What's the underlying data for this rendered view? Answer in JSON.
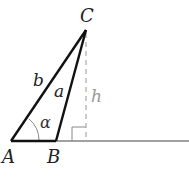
{
  "diagram": {
    "vertices": {
      "A": {
        "label": "A",
        "x": 11,
        "y": 141
      },
      "B": {
        "label": "B",
        "x": 56,
        "y": 141
      },
      "C": {
        "label": "C",
        "x": 86,
        "y": 30
      }
    },
    "sides": {
      "a": {
        "label": "a",
        "from": "B",
        "to": "C"
      },
      "b": {
        "label": "b",
        "from": "A",
        "to": "C"
      }
    },
    "height": {
      "label": "h",
      "style": "dashed",
      "color": "#999999"
    },
    "angle": {
      "label": "α",
      "at": "A"
    },
    "right_angle_marker": true,
    "colors": {
      "stroke": "#111111",
      "height_line": "#999999",
      "baseline": "#444444"
    }
  }
}
